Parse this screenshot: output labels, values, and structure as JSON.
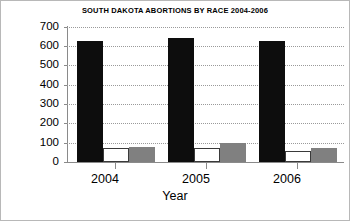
{
  "chart_data": {
    "type": "bar",
    "title": "SOUTH DAKOTA ABORTIONS BY RACE 2004-2006",
    "xlabel": "Year",
    "ylabel": "",
    "categories": [
      "2004",
      "2005",
      "2006"
    ],
    "ylim": [
      0,
      700
    ],
    "yticks": [
      0,
      100,
      200,
      300,
      400,
      500,
      600,
      700
    ],
    "ytick_labels": [
      "0",
      "100",
      "200",
      "300",
      "400",
      "500",
      "600",
      "700"
    ],
    "grid": true,
    "legend": "none",
    "series": [
      {
        "name": "series-1",
        "color": "#0d0d0d",
        "values": [
          625,
          640,
          625
        ]
      },
      {
        "name": "series-2",
        "color": "#ffffff",
        "values": [
          70,
          70,
          55
        ]
      },
      {
        "name": "series-3",
        "color": "#808080",
        "values": [
          75,
          100,
          70
        ]
      }
    ]
  },
  "axis": {
    "y_labels": [
      "700",
      "600",
      "500",
      "400",
      "300",
      "200",
      "100",
      "0"
    ],
    "x_labels": [
      "2004",
      "2005",
      "2006"
    ],
    "x_title": "Year"
  },
  "title": {
    "text": "SOUTH DAKOTA ABORTIONS BY RACE 2004-2006"
  }
}
